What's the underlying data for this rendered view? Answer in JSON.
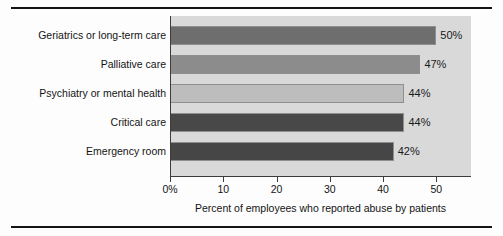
{
  "chart_data": {
    "type": "bar",
    "orientation": "horizontal",
    "title": "",
    "xlabel": "Percent of employees who reported abuse by patients",
    "ylabel": "",
    "categories": [
      "Geriatrics or long-term care",
      "Palliative care",
      "Psychiatry or mental health",
      "Critical care",
      "Emergency room"
    ],
    "values": [
      50,
      47,
      44,
      44,
      42
    ],
    "value_labels": [
      "50%",
      "47%",
      "44%",
      "44%",
      "42%"
    ],
    "bar_colors": [
      "#6e6e6e",
      "#8c8c8c",
      "#bdbdbd",
      "#484848",
      "#464646"
    ],
    "xlim": [
      0,
      56.5
    ],
    "xticks": [
      0,
      10,
      20,
      30,
      40,
      50
    ],
    "xtick_labels": [
      "0%",
      "10",
      "20",
      "30",
      "40",
      "50"
    ],
    "grid": false,
    "legend": null,
    "plot_background": "#d9d9d9",
    "axis_color": "#3c3c3c",
    "rule_color": "#141414"
  }
}
